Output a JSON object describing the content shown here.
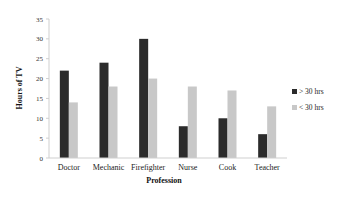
{
  "chart_data": {
    "type": "bar",
    "title": "",
    "xlabel": "Profession",
    "ylabel": "Hours of TV",
    "categories": [
      "Doctor",
      "Mechanic",
      "Firefighter",
      "Nurse",
      "Cook",
      "Teacher"
    ],
    "series": [
      {
        "name": "> 30 hrs",
        "color": "#2b2b2b",
        "values": [
          22,
          24,
          30,
          8,
          10,
          6
        ]
      },
      {
        "name": "< 30 hrs",
        "color": "#c8c8c8",
        "values": [
          14,
          18,
          20,
          18,
          17,
          13
        ]
      }
    ],
    "ylim": [
      0,
      35
    ],
    "yticks": [
      0,
      5,
      10,
      15,
      20,
      25,
      30,
      35
    ],
    "grid": false,
    "legend_position": "right"
  }
}
